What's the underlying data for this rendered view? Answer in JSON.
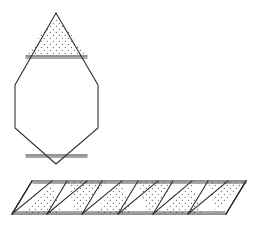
{
  "figure": {
    "title": "Hexagonal antiprism net",
    "background_color": "#ffffff",
    "stroke_color": "#2b2b2b",
    "stipple_dot_color": "#6b6b6b",
    "face_fill_color": "#ffffff",
    "canvas": {
      "width": 253,
      "height": 225
    },
    "parts": [
      {
        "name": "top-cap-and-bottom-cap-assembly",
        "description": "Vertical rhombus/hexagon outline with stippled triangular cap at top and stippled triangular cap at bottom",
        "label": ""
      },
      {
        "name": "triangle-strip",
        "description": "Horizontal parallelogram band of alternating up and down triangles, alternating faces stippled",
        "label": ""
      }
    ]
  },
  "chart_data": {
    "type": "diagram",
    "title": "Hexagonal antiprism net",
    "xlabel": "",
    "ylabel": "",
    "shapes": [
      {
        "id": "upper-hexagon-body",
        "kind": "polygon",
        "fill": "plain",
        "points": [
          [
            63,
            56
          ],
          [
            98,
            85
          ],
          [
            98,
            128
          ],
          [
            63,
            157
          ],
          [
            15,
            128
          ],
          [
            15,
            85
          ]
        ]
      },
      {
        "id": "top-stippled-triangle",
        "kind": "polygon",
        "fill": "stippled",
        "points": [
          [
            56,
            13
          ],
          [
            87,
            56
          ],
          [
            26,
            56
          ]
        ]
      },
      {
        "id": "bottom-stippled-triangle",
        "kind": "polygon",
        "fill": "stippled",
        "points": [
          [
            56,
            157
          ],
          [
            26,
            157
          ],
          [
            87,
            157
          ]
        ]
      }
    ],
    "strip": {
      "top_y": 181,
      "bottom_y": 214,
      "left_x": 12,
      "right_x": 246,
      "skew": 20,
      "triangle_count": 12,
      "half_width": 19.5,
      "stippled_pattern": "alternating"
    },
    "legend": [],
    "annotations": [],
    "grid": false
  }
}
